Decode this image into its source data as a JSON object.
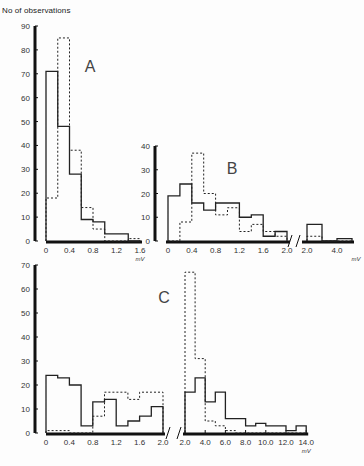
{
  "figure": {
    "ylabel": "No of observations",
    "unit": "mV"
  },
  "chart_data": [
    {
      "type": "bar",
      "title": "A",
      "xlabel": "mV",
      "ylabel": "No of observations",
      "ylim": [
        0,
        90
      ],
      "yticks": [
        0,
        10,
        20,
        30,
        40,
        50,
        60,
        70,
        80,
        90
      ],
      "xticks": [
        "0",
        "0.4",
        "0.8",
        "1.2",
        "1.6"
      ],
      "bin_edges": [
        0,
        0.2,
        0.4,
        0.6,
        0.8,
        1.0,
        1.2,
        1.4,
        1.6
      ],
      "series": [
        {
          "name": "solid",
          "style": "solid",
          "values": [
            71,
            48,
            28,
            9,
            8,
            3,
            3,
            0
          ]
        },
        {
          "name": "dashed",
          "style": "dashed",
          "values": [
            18,
            85,
            38,
            14,
            5,
            0,
            0,
            1
          ]
        }
      ]
    },
    {
      "type": "bar",
      "title": "B",
      "xlabel": "mV",
      "ylim": [
        0,
        40
      ],
      "yticks": [
        0,
        10,
        20,
        30,
        40
      ],
      "xticks": [
        "0",
        "0.4",
        "0.8",
        "1.2",
        "1.6",
        "2.0",
        "2.0",
        "4.0"
      ],
      "axis_break_after": 2.0,
      "bin_edges": [
        0,
        0.2,
        0.4,
        0.6,
        0.8,
        1.0,
        1.2,
        1.4,
        1.6,
        1.8,
        2.0
      ],
      "series": [
        {
          "name": "solid",
          "style": "solid",
          "values": [
            19,
            24,
            16,
            13,
            16,
            16,
            10,
            11,
            2,
            4
          ]
        },
        {
          "name": "dashed",
          "style": "dashed",
          "values": [
            0,
            8,
            37,
            20,
            11,
            14,
            4,
            7,
            4,
            2
          ]
        }
      ],
      "break_segment": {
        "bin_edges": [
          2.0,
          3.0,
          4.0,
          5.0
        ],
        "series": [
          {
            "name": "solid",
            "style": "solid",
            "values": [
              7,
              0,
              1
            ]
          },
          {
            "name": "dashed",
            "style": "dashed",
            "values": [
              2,
              0,
              0
            ]
          }
        ]
      }
    },
    {
      "type": "bar",
      "title": "C",
      "xlabel": "mV",
      "ylim": [
        0,
        70
      ],
      "yticks": [
        0,
        10,
        20,
        30,
        40,
        50,
        60,
        70
      ],
      "xticks": [
        "0",
        "0.4",
        "0.8",
        "1.2",
        "1.6",
        "2.0",
        "2.0",
        "4.0",
        "6.0",
        "8.0",
        "10.0",
        "12.0",
        "14.0"
      ],
      "axis_break_after": 2.0,
      "bin_edges": [
        0,
        0.2,
        0.4,
        0.6,
        0.8,
        1.0,
        1.2,
        1.4,
        1.6,
        1.8,
        2.0
      ],
      "series": [
        {
          "name": "solid",
          "style": "solid",
          "values": [
            24,
            23,
            20,
            3,
            13,
            14,
            3,
            5,
            7,
            11
          ]
        },
        {
          "name": "dashed",
          "style": "dashed",
          "values": [
            1,
            1,
            0,
            0,
            7,
            17,
            17,
            14,
            17,
            17
          ]
        }
      ],
      "break_segment": {
        "bin_edges": [
          2,
          3,
          4,
          5,
          6,
          7,
          8,
          9,
          10,
          11,
          12,
          13,
          14
        ],
        "series": [
          {
            "name": "solid",
            "style": "solid",
            "values": [
              17,
              23,
              13,
              17,
              6,
              6,
              3,
              4,
              3,
              3,
              1,
              3
            ]
          },
          {
            "name": "dashed",
            "style": "dashed",
            "values": [
              67,
              31,
              5,
              3,
              1,
              0,
              0,
              0,
              0,
              0,
              0,
              0
            ]
          }
        ]
      }
    }
  ]
}
